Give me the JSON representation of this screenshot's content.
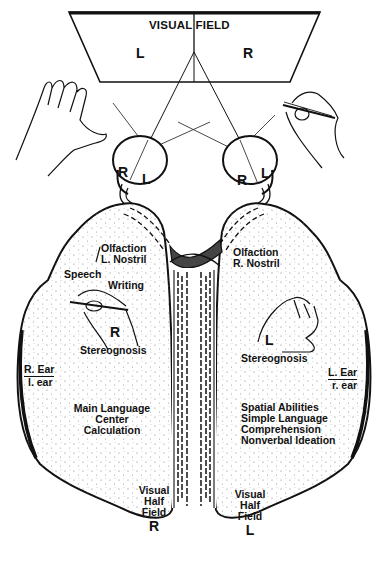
{
  "visual_field": {
    "title": "VISUAL FIELD",
    "left": "L",
    "right": "R"
  },
  "eyes": {
    "left_eye": {
      "r": "R",
      "l": "L"
    },
    "right_eye": {
      "r": "R",
      "l": "L"
    }
  },
  "left_hemisphere": {
    "olfaction": [
      "Olfaction",
      "L. Nostril"
    ],
    "speech": "Speech",
    "writing": "Writing",
    "hand_label": "R",
    "stereognosis": "Stereognosis",
    "ear_major": "R. Ear",
    "ear_minor": "l. ear",
    "functions": [
      "Main Language",
      "Center",
      "Calculation"
    ],
    "visual_half_field": [
      "Visual",
      "Half",
      "Field"
    ],
    "visual_half_field_side": "R"
  },
  "right_hemisphere": {
    "olfaction": [
      "Olfaction",
      "R. Nostril"
    ],
    "hand_label": "L",
    "stereognosis": "Stereognosis",
    "ear_major": "L. Ear",
    "ear_minor": "r. ear",
    "functions": [
      "Spatial Abilities",
      "Simple Language",
      "Comprehension",
      "Nonverbal Ideation"
    ],
    "visual_half_field": [
      "Visual",
      "Half",
      "Field"
    ],
    "visual_half_field_side": "L"
  },
  "colors": {
    "ink": "#111111",
    "stipple": "#555555",
    "paper": "#ffffff"
  }
}
